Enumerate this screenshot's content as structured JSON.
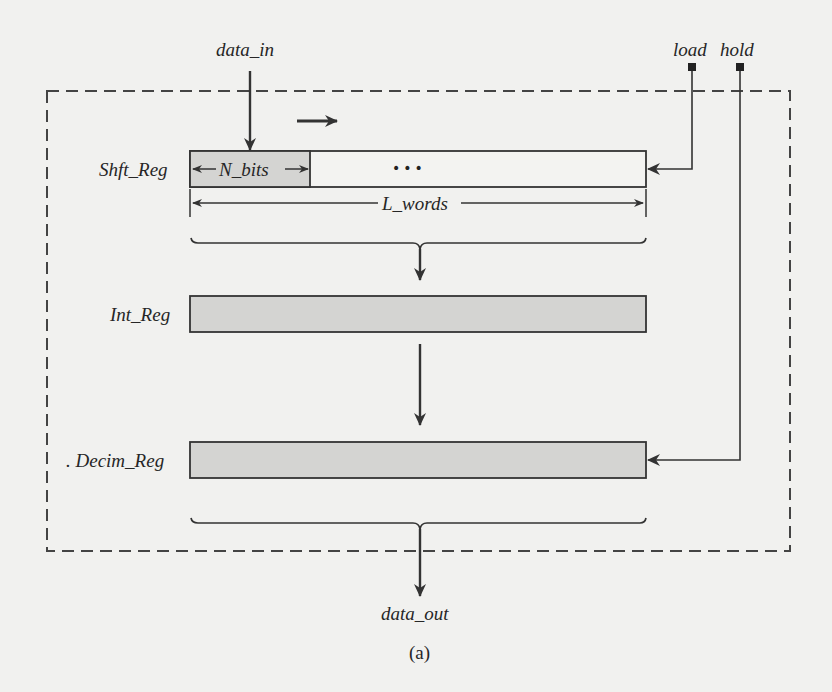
{
  "figure": {
    "caption": "(a)",
    "colors": {
      "background": "#f1f1ef",
      "stroke": "#333333",
      "register_fill": "#d4d4d2",
      "shift_body_fill": "#f3f3f1",
      "dashed_border": "#444444"
    }
  },
  "inputs": {
    "data_in": "data_in",
    "load": "load",
    "hold": "hold"
  },
  "outputs": {
    "data_out": "data_out"
  },
  "registers": [
    {
      "id": "shft_reg",
      "label": "Shft_Reg",
      "segment_label": "N_bits",
      "ellipsis": "•••",
      "width_label": "L_words",
      "shift_direction": "right"
    },
    {
      "id": "int_reg",
      "label": "Int_Reg"
    },
    {
      "id": "decim_reg",
      "label": ". Decim_Reg"
    }
  ]
}
